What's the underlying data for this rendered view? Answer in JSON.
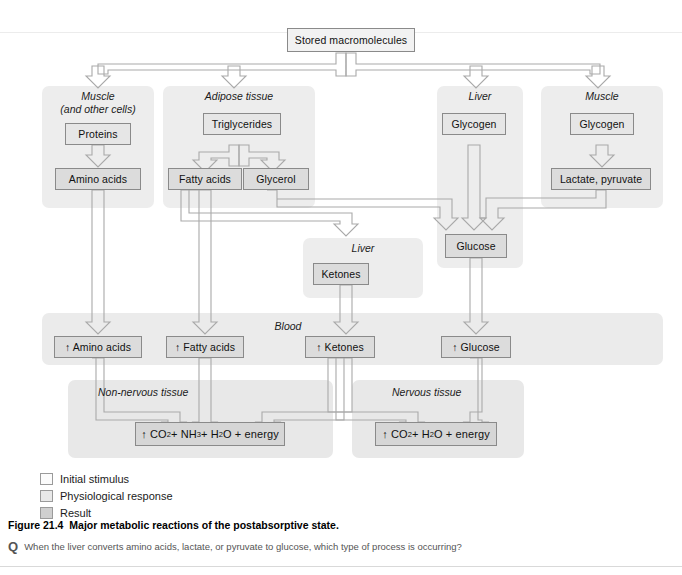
{
  "figure": {
    "caption_number": "Figure 21.4",
    "caption_text": "Major metabolic reactions of the postabsorptive state.",
    "question_marker": "Q",
    "question_text": "When the liver converts amino acids, lactate, or pyruvate to glucose, which type of process is occurring?"
  },
  "top": {
    "stored_macromolecules": "Stored macromolecules"
  },
  "panels": {
    "muscle_cells": {
      "label_line1": "Muscle",
      "label_line2": "(and other cells)"
    },
    "adipose": {
      "label": "Adipose tissue"
    },
    "liver_glycogen": {
      "label": "Liver"
    },
    "muscle_glycogen": {
      "label": "Muscle"
    },
    "liver_ketones": {
      "label": "Liver"
    },
    "blood": {
      "label": "Blood"
    },
    "non_nervous": {
      "label": "Non-nervous tissue"
    },
    "nervous": {
      "label": "Nervous tissue"
    }
  },
  "nodes": {
    "proteins": "Proteins",
    "amino_acids": "Amino acids",
    "triglycerides": "Triglycerides",
    "fatty_acids": "Fatty acids",
    "glycerol": "Glycerol",
    "liver_glycogen": "Glycogen",
    "muscle_glycogen": "Glycogen",
    "lactate_pyruvate": "Lactate, pyruvate",
    "glucose": "Glucose",
    "ketones": "Ketones"
  },
  "blood_nodes": {
    "amino_acids": "↑ Amino acids",
    "fatty_acids": "↑ Fatty acids",
    "ketones": "↑ Ketones",
    "glucose": "↑ Glucose"
  },
  "results": {
    "non_nervous_prefix": "↑ CO",
    "non_nervous_sub1": "2",
    "non_nervous_mid1": " + NH",
    "non_nervous_sub2": "3",
    "non_nervous_mid2": " + H",
    "non_nervous_sub3": "2",
    "non_nervous_end": "O + energy",
    "nervous_prefix": "↑ CO",
    "nervous_sub1": "2",
    "nervous_mid1": " + H",
    "nervous_sub2": "2",
    "nervous_end": "O + energy"
  },
  "legend": {
    "items": [
      {
        "label": "Initial stimulus",
        "color": "#fbfbfb"
      },
      {
        "label": "Physiological response",
        "color": "#e9e9e9"
      },
      {
        "label": "Result",
        "color": "#cfcfcf"
      }
    ]
  },
  "colors": {
    "panel_bg": "#ededed",
    "node_bg": "#dcdcdc",
    "node_border": "#8a8a8a",
    "wire": "#a9a9a9",
    "wire_fill": "#e4e4e4"
  }
}
